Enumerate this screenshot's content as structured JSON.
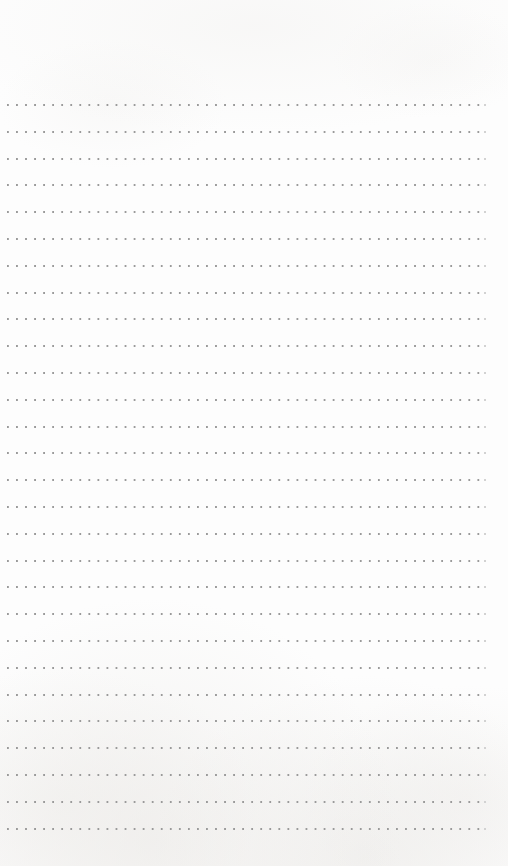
{
  "page": {
    "kind": "dot-grid-notebook-page",
    "width": 508,
    "height": 866,
    "background_color": "#fdfdfd",
    "paper_tint_color": "#e9e7e4",
    "content_text": "",
    "is_blank": true
  },
  "grid": {
    "type": "dotted-rule-rows",
    "row_count": 28,
    "first_row_y": 104,
    "row_spacing": 26.8,
    "dot_color": "#9a9a9a",
    "dot_tail_color": "#d2d2d2",
    "dot_size": 2,
    "dot_pitch": 9.05,
    "row_start_x": 7,
    "row_end_x": 481,
    "row_width": 474,
    "tail_x": 484,
    "margins": {
      "top": 95,
      "bottom": 38,
      "left": 7,
      "right": 27
    }
  }
}
